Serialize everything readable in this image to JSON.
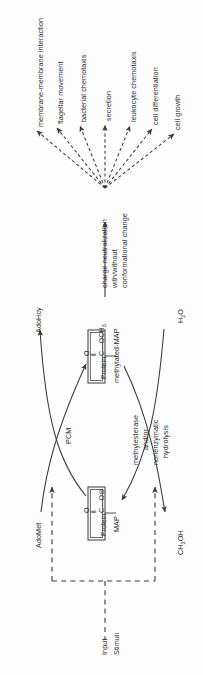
{
  "figure": {
    "orientation": "rotated-90",
    "background_color": "#fdfdfd",
    "line_color": "#3a3a3a"
  },
  "outcomes": {
    "note": "fan of seven dashed arrows radiating from the charge-neutralization node",
    "items": [
      {
        "label": "membrane-membrane interaction"
      },
      {
        "label": "flagellar movement"
      },
      {
        "label": "bacterial chemotaxis"
      },
      {
        "label": "secretion"
      },
      {
        "label": "leukocyte chemotaxis"
      },
      {
        "label": "cell differentiation"
      },
      {
        "label": "cell growth"
      }
    ]
  },
  "effect_node": {
    "line1": "charge neutralization",
    "line2": "with/without",
    "line3": "conformational change"
  },
  "methylated_species": {
    "box_label": "Protein",
    "name": "methylated-MAP",
    "group_oxygen": "O",
    "group_double_bond": "‖",
    "group_chain": "C—OCH",
    "group_chain_sub": "3"
  },
  "unmethylated_species": {
    "box_label": "Protein",
    "name": "MAP",
    "group_oxygen": "O",
    "group_double_bond": "‖",
    "group_chain": "C—O",
    "group_charge": "⊖"
  },
  "enzymes": {
    "methyltransferase": "PCM",
    "esterase_line1": "methylesterase",
    "esterase_line2": "and/or",
    "esterase_line3": "nonenzymatic",
    "esterase_line4": "hydrolysis"
  },
  "cofactors": {
    "donor_in": "AdoMet",
    "donor_out": "AdoHcy",
    "water_in": "H",
    "water_in_sub": "2",
    "water_in_tail": "O",
    "methanol_out": "CH",
    "methanol_out_sub": "3",
    "methanol_out_tail": "OH"
  },
  "feedback": {
    "line1": "Input",
    "line2": "Stimuli"
  }
}
